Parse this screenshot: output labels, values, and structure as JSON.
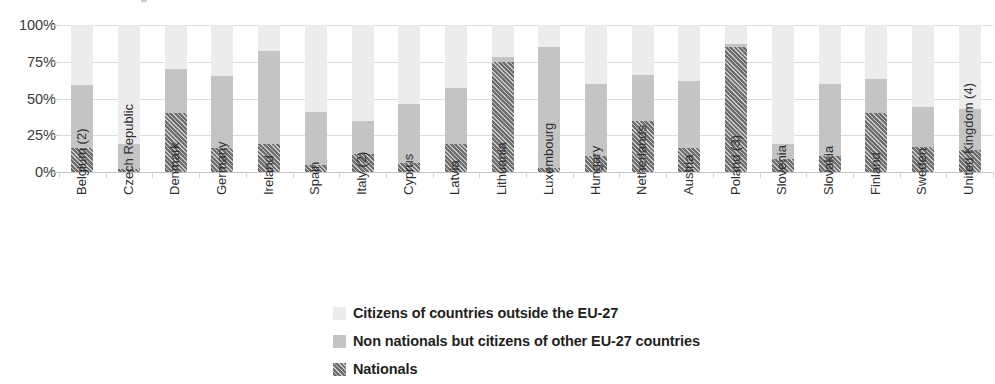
{
  "top_partial_text": "g",
  "chart_data": {
    "type": "bar",
    "subtype": "stacked-bar-100",
    "title": "",
    "subtitle": "",
    "xlabel": "",
    "ylabel": "",
    "ylim": [
      0,
      100
    ],
    "grid": true,
    "legend_position": "bottom-center",
    "ytick_labels": [
      "100%",
      "75%",
      "50%",
      "25%",
      "0%"
    ],
    "ytick_values": [
      100,
      75,
      50,
      25,
      0
    ],
    "categories": [
      "Belgium (2)",
      "Czech Republic",
      "Denmark",
      "Germany",
      "Ireland",
      "Spain",
      "Italy (2)",
      "Cyprus",
      "Latvia",
      "Lithuania",
      "Luxembourg",
      "Hungary",
      "Netherlands",
      "Austria",
      "Poland (3)",
      "Slovenia",
      "Slovakia",
      "Finland",
      "Sweden",
      "United Kingdom (4)"
    ],
    "series": [
      {
        "name": "Nationals",
        "color": "#6e6e6e",
        "pattern": "diagonal-hatch",
        "values": [
          16,
          2,
          40,
          16,
          19,
          5,
          12,
          6,
          19,
          75,
          3,
          11,
          35,
          16,
          85,
          9,
          11,
          40,
          17,
          15
        ]
      },
      {
        "name": "Non nationals but citizens of other EU-27 countries",
        "color": "#c4c4c4",
        "pattern": "solid",
        "values": [
          43,
          17,
          30,
          49,
          63,
          36,
          23,
          40,
          38,
          3,
          82,
          49,
          31,
          46,
          2,
          10,
          49,
          23,
          27,
          28
        ]
      },
      {
        "name": "Citizens of countries outside the EU-27",
        "color": "#ececec",
        "pattern": "solid",
        "values": [
          41,
          81,
          30,
          35,
          18,
          59,
          65,
          54,
          43,
          22,
          15,
          40,
          34,
          38,
          13,
          81,
          40,
          37,
          56,
          57
        ]
      }
    ],
    "stack_tops": {
      "nationals": [
        16,
        2,
        40,
        16,
        19,
        5,
        12,
        6,
        19,
        75,
        3,
        11,
        35,
        16,
        85,
        9,
        11,
        40,
        17,
        15
      ],
      "nationals_plus_eu": [
        59,
        19,
        70,
        65,
        82,
        41,
        35,
        46,
        57,
        78,
        85,
        60,
        66,
        62,
        87,
        19,
        60,
        63,
        44,
        43
      ],
      "total": [
        100,
        100,
        100,
        100,
        100,
        100,
        100,
        100,
        100,
        100,
        100,
        100,
        100,
        100,
        100,
        100,
        100,
        100,
        100,
        100
      ]
    },
    "legend": [
      {
        "label": "Citizens of countries outside the EU-27",
        "color": "#ececec",
        "pattern": "solid"
      },
      {
        "label": "Non nationals but citizens of other EU-27 countries",
        "color": "#c4c4c4",
        "pattern": "solid"
      },
      {
        "label": "Nationals",
        "color": "#6e6e6e",
        "pattern": "diagonal-hatch"
      }
    ]
  }
}
